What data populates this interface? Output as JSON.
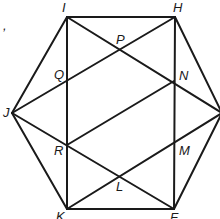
{
  "figure": {
    "stray_text": ",",
    "points": {
      "I": {
        "x": 67,
        "y": 17,
        "label": "I",
        "lx": 62,
        "ly": 12
      },
      "H": {
        "x": 175,
        "y": 17,
        "label": "H",
        "lx": 173,
        "ly": 12
      },
      "G": {
        "x": 222,
        "y": 113,
        "label": "",
        "lx": 0,
        "ly": 0
      },
      "F": {
        "x": 174,
        "y": 209,
        "label": "F",
        "lx": 170,
        "ly": 222
      },
      "K": {
        "x": 67,
        "y": 209,
        "label": "K",
        "lx": 56,
        "ly": 221
      },
      "J": {
        "x": 12,
        "y": 113,
        "label": "J",
        "lx": 3,
        "ly": 117
      },
      "P": {
        "x": 121,
        "y": 49,
        "label": "P",
        "lx": 116,
        "ly": 44
      },
      "Q": {
        "x": 67,
        "y": 80,
        "label": "Q",
        "lx": 54,
        "ly": 79
      },
      "N": {
        "x": 174,
        "y": 81,
        "label": "N",
        "lx": 179,
        "ly": 80
      },
      "R": {
        "x": 67,
        "y": 145,
        "label": "R",
        "lx": 54,
        "ly": 155
      },
      "M": {
        "x": 174,
        "y": 143,
        "label": "M",
        "lx": 179,
        "ly": 155
      },
      "L": {
        "x": 120,
        "y": 177,
        "label": "L",
        "lx": 116,
        "ly": 191
      }
    },
    "segments": [
      [
        "I",
        "H"
      ],
      [
        "H",
        "G"
      ],
      [
        "G",
        "F"
      ],
      [
        "F",
        "K"
      ],
      [
        "K",
        "J"
      ],
      [
        "J",
        "I"
      ],
      [
        "I",
        "K"
      ],
      [
        "H",
        "F"
      ],
      [
        "I",
        "G"
      ],
      [
        "J",
        "H"
      ],
      [
        "J",
        "F"
      ],
      [
        "K",
        "G"
      ],
      [
        "R",
        "N"
      ]
    ]
  }
}
